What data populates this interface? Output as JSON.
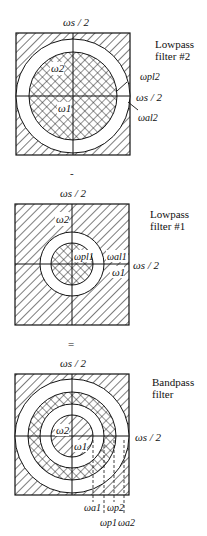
{
  "panels": [
    {
      "id": "lowpass2",
      "title_line1": "Lowpass",
      "title_line2": "filter #2",
      "top_label": "ωs / 2",
      "right_label": "ωs / 2",
      "w2_label": "ω2",
      "w1_label": "ω1",
      "annot1": "ωpl2",
      "annot2": "ωal2"
    },
    {
      "id": "lowpass1",
      "title_line1": "Lowpass",
      "title_line2": "filter #1",
      "top_label": "ωs / 2",
      "right_label": "ωs / 2",
      "w2_label": "ω2",
      "w1_label": "ω1",
      "annot1": "ωpl1",
      "annot2": "ωal1"
    },
    {
      "id": "bandpass",
      "title_line1": "Bandpass",
      "title_line2": "filter",
      "top_label": "ωs / 2",
      "right_label": "ωs / 2",
      "w2_label": "ω2",
      "w1_label": "ω1",
      "bottom_labels": [
        "ωa1",
        "ωp2",
        "ωp1",
        "ωa2"
      ]
    }
  ],
  "operators": [
    "-",
    "="
  ]
}
